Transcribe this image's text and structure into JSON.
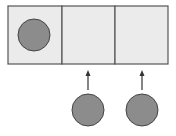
{
  "diagram": {
    "colors": {
      "cell_fill": "#ebebeb",
      "border": "#555555",
      "circle_fill": "#8c8c8c",
      "circle_stroke": "#444444",
      "arrow": "#333333"
    },
    "container": {
      "x": 8,
      "y": 6,
      "width": 160,
      "height": 58
    },
    "cells": [
      {
        "index": 0,
        "x": 8,
        "width": 54,
        "occupied": true
      },
      {
        "index": 1,
        "x": 62,
        "width": 53,
        "occupied": false
      },
      {
        "index": 2,
        "x": 115,
        "width": 53,
        "occupied": false
      }
    ],
    "circles": [
      {
        "id": "circle-in-cell-1",
        "cx": 34,
        "cy": 35,
        "r": 16
      },
      {
        "id": "circle-below-cell-2",
        "cx": 88,
        "cy": 110,
        "r": 16
      },
      {
        "id": "circle-below-cell-3",
        "cx": 142,
        "cy": 110,
        "r": 16
      }
    ],
    "arrows": [
      {
        "id": "arrow-to-cell-2",
        "x": 88,
        "y_from": 90,
        "y_to": 70
      },
      {
        "id": "arrow-to-cell-3",
        "x": 142,
        "y_from": 90,
        "y_to": 70
      }
    ]
  }
}
